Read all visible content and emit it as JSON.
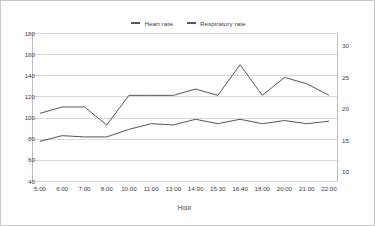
{
  "chart_data": {
    "type": "line",
    "title": "",
    "xlabel": "Hour",
    "ylabel": "",
    "grid": true,
    "legend_position": "top-center",
    "categories": [
      "5:00",
      "6:00",
      "7:00",
      "8:00",
      "10:00",
      "11:00",
      "13:00",
      "14:00",
      "15:30",
      "16:40",
      "18:00",
      "20:00",
      "21:00",
      "22:00"
    ],
    "axes": {
      "left": {
        "label": "",
        "ticks": [
          180,
          160,
          140,
          120,
          100,
          80,
          60,
          40
        ],
        "ylim": [
          40,
          180
        ]
      },
      "right": {
        "label": "",
        "ticks": [
          30,
          25,
          20,
          15,
          10
        ],
        "ylim": [
          8.5,
          32
        ]
      }
    },
    "series": [
      {
        "name": "Heart rate",
        "axis": "left",
        "color": "#565656",
        "values": [
          104,
          110,
          110,
          93,
          121,
          121,
          121,
          127,
          121,
          150,
          121,
          138,
          132,
          121
        ]
      },
      {
        "name": "Respiratory rate",
        "axis": "right",
        "color": "#565656",
        "values": [
          14.8,
          15.7,
          15.5,
          15.5,
          16.7,
          17.6,
          17.4,
          18.3,
          17.6,
          18.3,
          17.6,
          18.1,
          17.6,
          18.0
        ]
      }
    ]
  },
  "legend": {
    "entries": [
      {
        "label": "Heart rate"
      },
      {
        "label": "Respiratory rate"
      }
    ]
  },
  "axis_labels": {
    "left": [
      "180",
      "160",
      "140",
      "120",
      "100",
      "80",
      "60",
      "40"
    ],
    "right": [
      "30",
      "25",
      "20",
      "15",
      "10"
    ],
    "x": [
      "5:00",
      "6:00",
      "7:00",
      "8:00",
      "10:00",
      "11:00",
      "13:00",
      "14:00",
      "15:30",
      "16:40",
      "18:00",
      "20:00",
      "21:00",
      "22:00"
    ],
    "xaxis_title": "Hour"
  },
  "style": {
    "grid_color": "#d9d9d9",
    "line_color": "#565656",
    "text_color": "#3c3c3c",
    "border_color": "#c8c8c8",
    "background": "#ffffff"
  }
}
